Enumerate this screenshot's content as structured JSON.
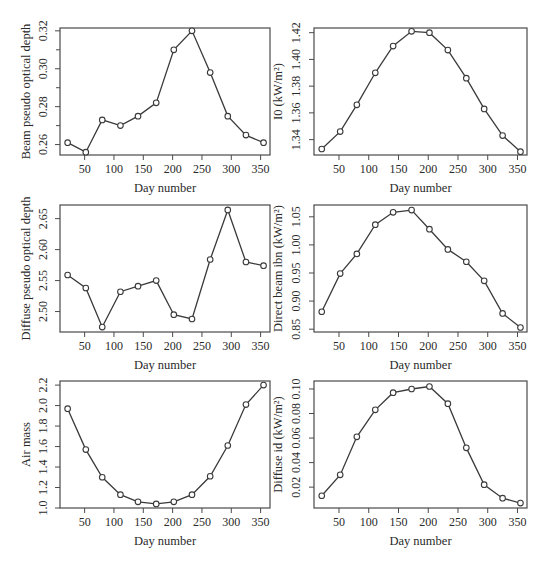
{
  "chart_data": [
    {
      "id": "beam-optical-depth",
      "type": "line",
      "xlabel": "Day number",
      "ylabel": "Beam pseudo optical depth",
      "x": [
        21,
        52,
        80,
        111,
        141,
        172,
        202,
        233,
        264,
        294,
        325,
        355
      ],
      "values": [
        0.261,
        0.256,
        0.273,
        0.27,
        0.275,
        0.282,
        0.31,
        0.32,
        0.298,
        0.275,
        0.265,
        0.261
      ],
      "xticks": [
        50,
        100,
        150,
        200,
        250,
        300,
        350
      ],
      "yticks": [
        0.26,
        0.28,
        0.3,
        0.32
      ],
      "yticks_minor": [
        0.27,
        0.29,
        0.31
      ],
      "xlim": [
        8,
        366
      ],
      "ylim": [
        0.2545,
        0.3215
      ],
      "marker": "open-circle",
      "grid": false
    },
    {
      "id": "extraterrestrial-i0",
      "type": "line",
      "xlabel": "Day number",
      "ylabel": "I0 (kW/m²)",
      "x": [
        21,
        52,
        80,
        111,
        141,
        172,
        202,
        233,
        264,
        294,
        325,
        355
      ],
      "values": [
        1.333,
        1.346,
        1.366,
        1.39,
        1.41,
        1.421,
        1.42,
        1.407,
        1.386,
        1.363,
        1.343,
        1.331
      ],
      "xticks": [
        50,
        100,
        150,
        200,
        250,
        300,
        350
      ],
      "yticks": [
        1.34,
        1.36,
        1.38,
        1.4,
        1.42
      ],
      "xlim": [
        8,
        366
      ],
      "ylim": [
        1.3285,
        1.4235
      ],
      "marker": "open-circle",
      "grid": false
    },
    {
      "id": "diffuse-optical-depth",
      "type": "line",
      "xlabel": "Day number",
      "ylabel": "Diffuse pseudo optical depth",
      "x": [
        21,
        52,
        80,
        111,
        141,
        172,
        202,
        233,
        264,
        294,
        325,
        355
      ],
      "values": [
        2.559,
        2.538,
        2.475,
        2.532,
        2.541,
        2.55,
        2.495,
        2.488,
        2.584,
        2.664,
        2.58,
        2.574
      ],
      "xticks": [
        50,
        100,
        150,
        200,
        250,
        300,
        350
      ],
      "yticks": [
        2.5,
        2.55,
        2.6,
        2.65
      ],
      "xlim": [
        8,
        366
      ],
      "ylim": [
        2.467,
        2.672
      ],
      "marker": "open-circle",
      "grid": false
    },
    {
      "id": "direct-beam-ibn",
      "type": "line",
      "xlabel": "Day number",
      "ylabel": "Direct beam ibn (kW/m²)",
      "x": [
        21,
        52,
        80,
        111,
        141,
        172,
        202,
        233,
        264,
        294,
        325,
        355
      ],
      "values": [
        0.881,
        0.949,
        0.984,
        1.036,
        1.058,
        1.062,
        1.028,
        0.992,
        0.97,
        0.936,
        0.878,
        0.853
      ],
      "xticks": [
        50,
        100,
        150,
        200,
        250,
        300,
        350
      ],
      "yticks": [
        0.85,
        0.9,
        0.95,
        1.0,
        1.05
      ],
      "xlim": [
        8,
        366
      ],
      "ylim": [
        0.845,
        1.071
      ],
      "marker": "open-circle",
      "grid": false
    },
    {
      "id": "air-mass",
      "type": "line",
      "xlabel": "Day number",
      "ylabel": "Air mass",
      "x": [
        21,
        52,
        80,
        111,
        141,
        172,
        202,
        233,
        264,
        294,
        325,
        355
      ],
      "values": [
        1.97,
        1.57,
        1.3,
        1.13,
        1.06,
        1.04,
        1.06,
        1.13,
        1.31,
        1.61,
        2.01,
        2.2
      ],
      "xticks": [
        50,
        100,
        150,
        200,
        250,
        300,
        350
      ],
      "yticks": [
        1.0,
        1.2,
        1.4,
        1.6,
        1.8,
        2.0,
        2.2
      ],
      "xlim": [
        8,
        366
      ],
      "ylim": [
        1.0,
        2.24
      ],
      "marker": "open-circle",
      "grid": false
    },
    {
      "id": "diffuse-id",
      "type": "line",
      "xlabel": "Day number",
      "ylabel": "Diffuse id (kW/m²)",
      "x": [
        21,
        52,
        80,
        111,
        141,
        172,
        202,
        233,
        264,
        294,
        325,
        355
      ],
      "values": [
        0.013,
        0.03,
        0.061,
        0.083,
        0.097,
        0.1,
        0.102,
        0.088,
        0.052,
        0.022,
        0.011,
        0.007
      ],
      "xticks": [
        50,
        100,
        150,
        200,
        250,
        300,
        350
      ],
      "yticks": [
        0.02,
        0.04,
        0.06,
        0.08,
        0.1
      ],
      "xlim": [
        8,
        366
      ],
      "ylim": [
        0.003,
        0.1065
      ],
      "marker": "open-circle",
      "grid": false
    }
  ],
  "layout": {
    "columns": [
      {
        "plot_left": 60,
        "plot_right": 270,
        "ylabel_x": 30,
        "tick_label_x": 47
      },
      {
        "plot_left": 314,
        "plot_right": 527,
        "ylabel_x": 282,
        "tick_label_x": 300
      }
    ],
    "rows": [
      {
        "plot_top": 28,
        "plot_bottom": 155
      },
      {
        "plot_top": 205,
        "plot_bottom": 332
      },
      {
        "plot_top": 381,
        "plot_bottom": 508
      }
    ],
    "line_color": "#3a3a3a",
    "axis_color": "#4a4a4a"
  }
}
